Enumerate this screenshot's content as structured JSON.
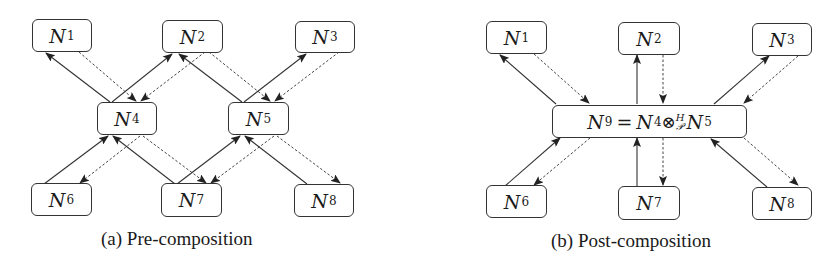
{
  "diagram_a": {
    "caption": "(a) Pre-composition",
    "nodes": [
      {
        "id": "N1",
        "label": "N",
        "sub": "1"
      },
      {
        "id": "N2",
        "label": "N",
        "sub": "2"
      },
      {
        "id": "N3",
        "label": "N",
        "sub": "3"
      },
      {
        "id": "N4",
        "label": "N",
        "sub": "4"
      },
      {
        "id": "N5",
        "label": "N",
        "sub": "5"
      },
      {
        "id": "N6",
        "label": "N",
        "sub": "6"
      },
      {
        "id": "N7",
        "label": "N",
        "sub": "7"
      },
      {
        "id": "N8",
        "label": "N",
        "sub": "8"
      }
    ],
    "edges": [
      {
        "from": "N4",
        "to": "N1",
        "style": "solid"
      },
      {
        "from": "N1",
        "to": "N4",
        "style": "dotted"
      },
      {
        "from": "N4",
        "to": "N2",
        "style": "solid"
      },
      {
        "from": "N2",
        "to": "N4",
        "style": "dotted"
      },
      {
        "from": "N5",
        "to": "N2",
        "style": "solid"
      },
      {
        "from": "N2",
        "to": "N5",
        "style": "dotted"
      },
      {
        "from": "N5",
        "to": "N3",
        "style": "solid"
      },
      {
        "from": "N3",
        "to": "N5",
        "style": "dotted"
      },
      {
        "from": "N6",
        "to": "N4",
        "style": "solid"
      },
      {
        "from": "N4",
        "to": "N6",
        "style": "dotted"
      },
      {
        "from": "N7",
        "to": "N4",
        "style": "solid"
      },
      {
        "from": "N4",
        "to": "N7",
        "style": "dotted"
      },
      {
        "from": "N7",
        "to": "N5",
        "style": "solid"
      },
      {
        "from": "N5",
        "to": "N7",
        "style": "dotted"
      },
      {
        "from": "N8",
        "to": "N5",
        "style": "solid"
      },
      {
        "from": "N5",
        "to": "N8",
        "style": "dotted"
      }
    ]
  },
  "diagram_b": {
    "caption": "(b) Post-composition",
    "nodes": [
      {
        "id": "N1",
        "label": "N",
        "sub": "1"
      },
      {
        "id": "N2",
        "label": "N",
        "sub": "2"
      },
      {
        "id": "N3",
        "label": "N",
        "sub": "3"
      },
      {
        "id": "N6",
        "label": "N",
        "sub": "6"
      },
      {
        "id": "N7",
        "label": "N",
        "sub": "7"
      },
      {
        "id": "N8",
        "label": "N",
        "sub": "8"
      }
    ],
    "composite": {
      "lhs": "N",
      "lhs_sub": "9",
      "eq": "=",
      "a": "N",
      "a_sub": "4",
      "operator": "⊗",
      "op_sup": "H",
      "op_sub": "𝒫",
      "b": "N",
      "b_sub": "5"
    },
    "edges": [
      {
        "from": "N9",
        "to": "N1",
        "style": "solid"
      },
      {
        "from": "N1",
        "to": "N9",
        "style": "dotted"
      },
      {
        "from": "N9",
        "to": "N2",
        "style": "solid"
      },
      {
        "from": "N2",
        "to": "N9",
        "style": "dotted"
      },
      {
        "from": "N9",
        "to": "N3",
        "style": "solid"
      },
      {
        "from": "N3",
        "to": "N9",
        "style": "dotted"
      },
      {
        "from": "N6",
        "to": "N9",
        "style": "solid"
      },
      {
        "from": "N9",
        "to": "N6",
        "style": "dotted"
      },
      {
        "from": "N7",
        "to": "N9",
        "style": "solid"
      },
      {
        "from": "N9",
        "to": "N7",
        "style": "dotted"
      },
      {
        "from": "N8",
        "to": "N9",
        "style": "solid"
      },
      {
        "from": "N9",
        "to": "N8",
        "style": "dotted"
      }
    ]
  }
}
